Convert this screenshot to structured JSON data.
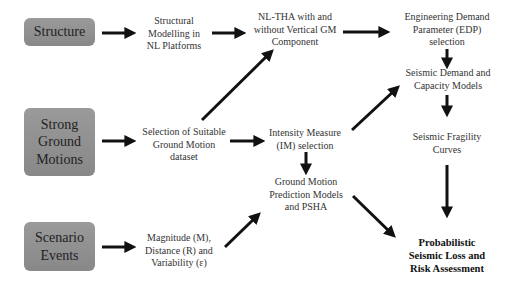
{
  "diagram": {
    "sources": [
      {
        "id": "structure",
        "label": "Structure"
      },
      {
        "id": "strong-ground-motions",
        "label": "Strong Ground Motions",
        "lines": [
          "Strong",
          "Ground",
          "Motions"
        ]
      },
      {
        "id": "scenario-events",
        "label": "Scenario Events",
        "lines": [
          "Scenario",
          "Events"
        ]
      }
    ],
    "nodes": {
      "structural_modelling": {
        "lines": [
          "Structural",
          "Modelling in",
          "NL Platforms"
        ]
      },
      "nltha": {
        "lines": [
          "NL-THA with and",
          "without Vertical GM",
          "Component"
        ]
      },
      "edp": {
        "lines": [
          "Engineering Demand",
          "Parameter (EDP)",
          "selection"
        ]
      },
      "gm_dataset": {
        "lines": [
          "Selection of Suitable",
          "Ground Motion",
          "dataset"
        ]
      },
      "im_selection": {
        "lines": [
          "Intensity Measure",
          "(IM) selection"
        ]
      },
      "demand_capacity": {
        "lines": [
          "Seismic Demand and",
          "Capacity Models"
        ]
      },
      "fragility": {
        "lines": [
          "Seismic Fragility",
          "Curves"
        ]
      },
      "gmpm_psha": {
        "lines": [
          "Ground Motion",
          "Prediction Models",
          "and PSHA"
        ]
      },
      "magnitude": {
        "lines": [
          "Magnitude (M),",
          "Distance (R) and",
          "Variability (ε)"
        ]
      },
      "loss_risk": {
        "lines": [
          "Probabilistic",
          "Seismic Loss and",
          "Risk Assessment"
        ]
      }
    },
    "edges": [
      [
        "structure",
        "structural_modelling"
      ],
      [
        "structural_modelling",
        "nltha"
      ],
      [
        "nltha",
        "edp"
      ],
      [
        "edp",
        "demand_capacity"
      ],
      [
        "strong-ground-motions",
        "gm_dataset"
      ],
      [
        "gm_dataset",
        "nltha"
      ],
      [
        "gm_dataset",
        "im_selection"
      ],
      [
        "im_selection",
        "demand_capacity"
      ],
      [
        "im_selection",
        "gmpm_psha"
      ],
      [
        "demand_capacity",
        "fragility"
      ],
      [
        "fragility",
        "loss_risk"
      ],
      [
        "scenario-events",
        "magnitude"
      ],
      [
        "magnitude",
        "gmpm_psha"
      ],
      [
        "gmpm_psha",
        "loss_risk"
      ]
    ],
    "colors": {
      "box_fill": "#8f8f8f",
      "arrow": "#111111",
      "background": "#ffffff"
    }
  }
}
